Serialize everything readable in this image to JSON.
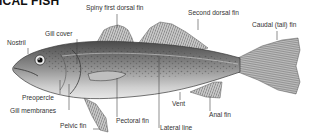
{
  "title": "ICAL FISH",
  "colors": {
    "label_text": "#333333",
    "leader_line": "#444444",
    "fish_dark": "#3a3a3a",
    "fish_mid": "#8a8a8a",
    "fish_light": "#d9d9d9"
  },
  "labels": {
    "spiny_first_dorsal_fin": "Spiny first dorsal fin",
    "second_dorsal_fin": "Second dorsal fin",
    "caudal_fin": "Caudal (tail) fin",
    "gill_cover": "Gill cover",
    "nostril": "Nostril",
    "preopercle": "Preopercle",
    "gill_membranes": "Gill membranes",
    "pelvic_fin": "Pelvic fin",
    "pectoral_fin": "Pectoral fin",
    "vent": "Vent",
    "anal_fin": "Anal fin",
    "lateral_line": "Lateral line"
  }
}
